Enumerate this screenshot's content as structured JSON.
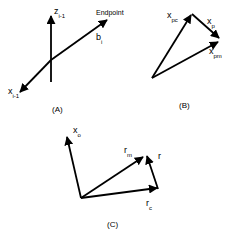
{
  "panels": [
    {
      "caption": "(A)",
      "labels": {
        "z": {
          "base": "z",
          "sub": "i-1"
        },
        "x": {
          "base": "x",
          "sub": "i-1"
        },
        "b": {
          "base": "b",
          "sub": "i"
        },
        "endpoint": "Endpoint"
      }
    },
    {
      "caption": "(B)",
      "labels": {
        "xpc": {
          "base": "x",
          "sub": "pc"
        },
        "xp": {
          "base": "x",
          "sub": "p"
        },
        "xpm": {
          "base": "x",
          "sub": "pm"
        }
      }
    },
    {
      "caption": "(C)",
      "labels": {
        "xo": {
          "base": "x",
          "sub": "o"
        },
        "rm": {
          "base": "r",
          "sub": "m"
        },
        "r": {
          "base": "r",
          "sub": ""
        },
        "rc": {
          "base": "r",
          "sub": "c"
        }
      }
    }
  ],
  "colors": {
    "stroke": "#000000",
    "background": "#ffffff"
  }
}
